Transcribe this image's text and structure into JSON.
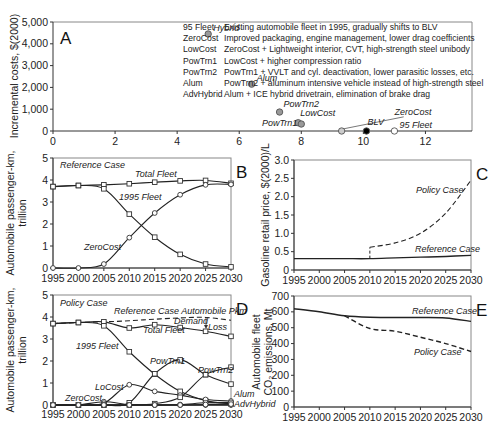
{
  "chart_data": [
    {
      "panel": "A",
      "type": "scatter",
      "title": "",
      "xlabel": "",
      "ylabel": "Incremental costs, $(2000)",
      "xlim": [
        0,
        13.5
      ],
      "ylim": [
        0,
        5000
      ],
      "xticks": [
        0,
        2,
        4,
        6,
        8,
        10,
        12
      ],
      "yticks": [
        0,
        1000,
        2000,
        3000,
        4000,
        5000
      ],
      "ytick_labels": [
        "0",
        "1,000",
        "2,000",
        "3,000",
        "4,000",
        "5,000"
      ],
      "points": [
        {
          "label": "Hybrid",
          "x": 5.0,
          "y": 4450,
          "fill": "#999999"
        },
        {
          "label": "Alum",
          "x": 6.4,
          "y": 2150,
          "fill": "#999999"
        },
        {
          "label": "PowTrn2",
          "x": 7.3,
          "y": 870,
          "fill": "#999999"
        },
        {
          "label": "LowCost",
          "x": 7.9,
          "y": 380,
          "fill": "#999999"
        },
        {
          "label": "PowTrn1",
          "x": 8.0,
          "y": 320,
          "fill": "#999999"
        },
        {
          "label": "ZeroCost",
          "x": 9.3,
          "y": 0,
          "fill": "#cccccc"
        },
        {
          "label": "BLV",
          "x": 10.1,
          "y": 0,
          "fill": "#000000"
        },
        {
          "label": "95 Fleet",
          "x": 11.0,
          "y": 0,
          "fill": "#ffffff"
        }
      ],
      "legend": [
        {
          "key": "95 Fleet",
          "desc": "Existing automobile fleet in 1995, gradually shifts to BLV"
        },
        {
          "key": "ZeroCost",
          "desc": "Improved packaging, engine management, lower drag coefficients"
        },
        {
          "key": "LowCost",
          "desc": "ZeroCost + Lightweight interior, CVT, high-strength steel unibody"
        },
        {
          "key": "PowTrn1",
          "desc": "LowCost + higher compression ratio"
        },
        {
          "key": "PowTrn2",
          "desc": "PowTrn1 + VVLT and cyl. deactivation, lower parasitic losses, etc."
        },
        {
          "key": "Alum",
          "desc": "PowTrn2 + aluminum intensive vehicle instead of high-strength steel"
        },
        {
          "key": "AdvHybrid",
          "desc": "Alum + ICE hybrid drivetrain, elimination of brake drag"
        }
      ]
    },
    {
      "panel": "B",
      "type": "line",
      "annotation": "Reference Case",
      "xlabel": "",
      "ylabel": "Automobile passenger-km, trillion",
      "ylim": [
        0,
        5
      ],
      "x": [
        1995,
        2000,
        2005,
        2010,
        2015,
        2020,
        2025,
        2030
      ],
      "series": [
        {
          "name": "Total Fleet",
          "marker": "square",
          "values": [
            3.7,
            3.75,
            3.78,
            3.83,
            3.9,
            3.96,
            3.98,
            3.85
          ]
        },
        {
          "name": "1995 Fleet",
          "marker": "square",
          "values": [
            3.7,
            3.75,
            3.6,
            2.45,
            1.4,
            0.62,
            0.18,
            0.05
          ]
        },
        {
          "name": "ZeroCost",
          "marker": "circle",
          "values": [
            0,
            0,
            0.18,
            1.38,
            2.5,
            3.33,
            3.78,
            3.8
          ]
        }
      ]
    },
    {
      "panel": "C",
      "type": "line",
      "xlabel": "",
      "ylabel": "Gasoline retail price, $(2000)/L",
      "ylim": [
        0,
        3.0
      ],
      "x": [
        1995,
        2000,
        2005,
        2010,
        2015,
        2020,
        2025,
        2030
      ],
      "series": [
        {
          "name": "Reference Case",
          "style": "solid",
          "values": [
            0.31,
            0.31,
            0.31,
            0.31,
            0.33,
            0.35,
            0.37,
            0.4
          ]
        },
        {
          "name": "Policy Case",
          "style": "dashed",
          "values": [
            null,
            null,
            null,
            0.62,
            0.74,
            1.0,
            1.55,
            2.45
          ]
        }
      ]
    },
    {
      "panel": "D",
      "type": "line",
      "annotation": "Policy Case",
      "xlabel": "",
      "ylabel": "Automobile passenger-km, trillion",
      "ylim": [
        0,
        5
      ],
      "x": [
        1995,
        2000,
        2005,
        2010,
        2015,
        2020,
        2025,
        2030
      ],
      "annotations": [
        "Reference Case Automobile Pkm",
        "Demand",
        "Loss"
      ],
      "series": [
        {
          "name": "Reference Case Automobile Pkm",
          "style": "dashed",
          "values": [
            3.7,
            3.75,
            3.78,
            3.83,
            3.9,
            3.96,
            3.98,
            3.85
          ]
        },
        {
          "name": "Total Fleet",
          "marker": "square",
          "values": [
            3.7,
            3.75,
            3.78,
            3.5,
            3.65,
            3.52,
            3.35,
            3.12
          ]
        },
        {
          "name": "1995 Fleet",
          "marker": "square",
          "values": [
            3.7,
            3.75,
            3.6,
            2.42,
            1.4,
            0.62,
            0.2,
            0.05
          ]
        },
        {
          "name": "ZeroCost",
          "marker": "circle",
          "values": [
            0,
            0,
            0.15,
            0.02,
            0,
            0,
            0,
            0
          ]
        },
        {
          "name": "LoCost",
          "marker": "circle",
          "values": [
            0,
            0,
            0.08,
            0.92,
            0.62,
            0.45,
            0.25,
            0.18
          ]
        },
        {
          "name": "PowTrn1",
          "marker": "square",
          "values": [
            0,
            0,
            0,
            0.1,
            1.42,
            2.05,
            1.38,
            0.95
          ]
        },
        {
          "name": "PowTrn2",
          "marker": "square",
          "values": [
            0,
            0,
            0,
            0,
            0.06,
            0.35,
            1.38,
            1.72
          ]
        },
        {
          "name": "Alum",
          "marker": "circle",
          "values": [
            0,
            0,
            0,
            0,
            0,
            0.02,
            0.1,
            0.12
          ]
        },
        {
          "name": "AdvHybrid",
          "marker": "circle",
          "values": [
            0,
            0,
            0,
            0,
            0,
            0,
            0.02,
            0.04
          ]
        }
      ]
    },
    {
      "panel": "E",
      "type": "line",
      "xlabel": "",
      "ylabel": "Automobile fleet CO2 emissions, Mt",
      "ylim": [
        0,
        700
      ],
      "x": [
        1995,
        2000,
        2005,
        2010,
        2015,
        2020,
        2025,
        2030
      ],
      "series": [
        {
          "name": "Reference Case",
          "style": "solid",
          "values": [
            620,
            600,
            575,
            566,
            565,
            565,
            562,
            540
          ]
        },
        {
          "name": "Policy Case",
          "style": "dashed",
          "values": [
            620,
            600,
            575,
            495,
            478,
            440,
            400,
            350
          ]
        }
      ]
    }
  ],
  "labels": {
    "panel_a": "A",
    "panel_b": "B",
    "panel_c": "C",
    "panel_d": "D",
    "panel_e": "E",
    "ylabel_a": "Incremental costs, $(2000)",
    "ylabel_b_1": "Automobile passenger-km,",
    "ylabel_b_2": "trillion",
    "ylabel_c": "Gasoline retail price, $(2000)/L",
    "ylabel_d_1": "Automobile passenger-km,",
    "ylabel_d_2": "trillion",
    "ylabel_e_1": "Automobile fleet",
    "ylabel_e_2": "CO₂ emissions, Mt",
    "ref_case": "Reference Case",
    "policy_case": "Policy Case",
    "total_fleet": "Total Fleet",
    "fleet_1995": "1995 Fleet",
    "zerocost": "ZeroCost",
    "locost": "LoCost",
    "powtrn1": "PowTrn1",
    "powtrn2": "PowTrn2",
    "lowcost": "LowCost",
    "hybrid": "Hybrid",
    "alum": "Alum",
    "advhybrid": "AdvHybrid",
    "blv": "BLV",
    "fleet95": "95 Fleet",
    "ref_pkm": "Reference Case Automobile Pkm",
    "demand": "Demand",
    "loss": "Loss"
  }
}
